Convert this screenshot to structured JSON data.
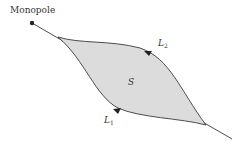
{
  "diagram": {
    "labels": {
      "monopole": "Monopole",
      "surface": "S",
      "loop1_main": "L",
      "loop1_sub": "1",
      "loop2_main": "L",
      "loop2_sub": "2"
    },
    "colors": {
      "stroke": "#3a3a3a",
      "fill": "#dcdcdc",
      "text": "#333333"
    }
  }
}
